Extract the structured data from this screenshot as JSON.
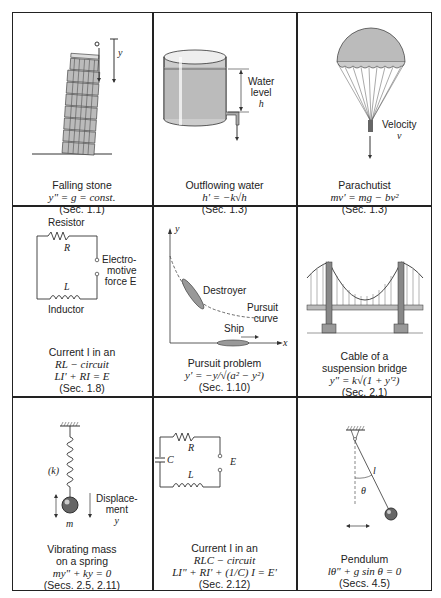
{
  "figure": {
    "grid": {
      "rows": 3,
      "cols": 3
    },
    "cells": [
      {
        "id": "falling-stone",
        "title": "Falling stone",
        "equation": "y\" = g = const.",
        "section": "(Sec. 1.1)",
        "labels": {
          "y": "y"
        }
      },
      {
        "id": "outflowing-water",
        "title": "Outflowing water",
        "equation": "h' = −k√h",
        "section": "(Sec. 1.3)",
        "labels": {
          "water": "Water",
          "level": "level",
          "h": "h"
        }
      },
      {
        "id": "parachutist",
        "title": "Parachutist",
        "equation": "mv' = mg − bv²",
        "section": "(Sec. 1.3)",
        "labels": {
          "velocity": "Velocity",
          "v": "v"
        }
      },
      {
        "id": "rl-circuit",
        "title_line1": "Current I in an",
        "title_line2": "RL − circuit",
        "equation": "LI' + RI = E",
        "section": "(Sec. 1.8)",
        "labels": {
          "resistor": "Resistor",
          "R": "R",
          "emf1": "Electro-",
          "emf2": "motive",
          "emf3": "force E",
          "L": "L",
          "inductor": "Inductor"
        }
      },
      {
        "id": "pursuit-problem",
        "title": "Pursuit problem",
        "equation": "y' = −y/√(a² − y²)",
        "section": "(Sec. 1.10)",
        "labels": {
          "y": "y",
          "x": "x",
          "destroyer": "Destroyer",
          "pursuit1": "Pursuit",
          "pursuit2": "curve",
          "ship": "Ship"
        }
      },
      {
        "id": "suspension-bridge",
        "title_line1": "Cable of a",
        "title_line2": "suspension bridge",
        "equation": "y\" = k√(1 + y'²)",
        "section": "(Sec. 2.1)",
        "labels": {}
      },
      {
        "id": "mass-spring",
        "title_line1": "Vibrating mass",
        "title_line2": "on a spring",
        "equation": "my\" + ky = 0",
        "section": "(Secs. 2.5, 2.11)",
        "labels": {
          "k": "(k)",
          "disp1": "Displace-",
          "disp2": "ment",
          "y": "y",
          "m": "m"
        }
      },
      {
        "id": "rlc-circuit",
        "title_line1": "Current I in an",
        "title_line2": "RLC − circuit",
        "equation": "LI\" + RI' + (1/C) I = E'",
        "section": "(Sec. 2.12)",
        "labels": {
          "R": "R",
          "C": "C",
          "E": "E",
          "L": "L"
        }
      },
      {
        "id": "pendulum",
        "title": "Pendulum",
        "equation": "lθ\" + g sin θ = 0",
        "section": "(Secs. 4.5)",
        "labels": {
          "l": "l",
          "theta": "θ"
        }
      }
    ]
  }
}
